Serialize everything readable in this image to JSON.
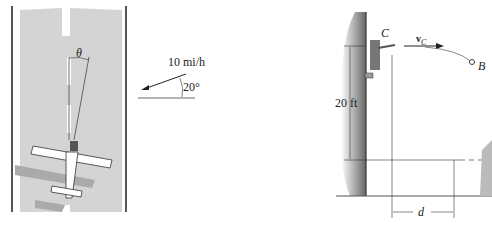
{
  "figure_left": {
    "angle_label": "θ",
    "wind_speed_label": "10 mi/h",
    "wind_angle_label": "20°"
  },
  "figure_right": {
    "point_c_label": "C",
    "velocity_label": "v",
    "velocity_subscript": "C",
    "point_b_label": "B",
    "height_label": "20 ft",
    "distance_label": "d"
  }
}
